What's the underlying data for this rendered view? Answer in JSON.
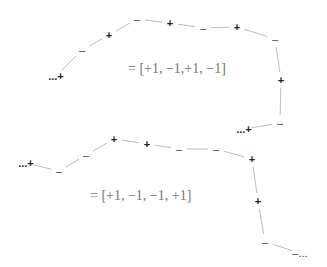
{
  "diagram": {
    "chains": [
      {
        "name": "chain-a",
        "equation": "= [+1, −1,+1, −1]",
        "equation_pos": [
          128,
          70
        ],
        "nodes": [
          {
            "label": "...+",
            "x": 56,
            "y": 76
          },
          {
            "label": "–",
            "x": 82,
            "y": 50
          },
          {
            "label": "+",
            "x": 109,
            "y": 35
          },
          {
            "label": "–",
            "x": 137,
            "y": 19
          },
          {
            "label": "+",
            "x": 170,
            "y": 23
          },
          {
            "label": "–",
            "x": 203,
            "y": 28
          },
          {
            "label": "+",
            "x": 237,
            "y": 27
          },
          {
            "label": "–",
            "x": 275,
            "y": 39
          },
          {
            "label": "+",
            "x": 281,
            "y": 80
          },
          {
            "label": "–",
            "x": 280,
            "y": 123
          },
          {
            "label": "...+",
            "x": 244,
            "y": 129
          }
        ]
      },
      {
        "name": "chain-b",
        "equation": "= [+1, −1, −1, +1]",
        "equation_pos": [
          90,
          197
        ],
        "nodes": [
          {
            "label": "...+",
            "x": 26,
            "y": 163
          },
          {
            "label": "–",
            "x": 59,
            "y": 171
          },
          {
            "label": "–",
            "x": 86,
            "y": 155
          },
          {
            "label": "+",
            "x": 114,
            "y": 139
          },
          {
            "label": "+",
            "x": 147,
            "y": 144
          },
          {
            "label": "–",
            "x": 179,
            "y": 149
          },
          {
            "label": "–",
            "x": 216,
            "y": 149
          },
          {
            "label": "+",
            "x": 252,
            "y": 159
          },
          {
            "label": "+",
            "x": 258,
            "y": 201
          },
          {
            "label": "–",
            "x": 265,
            "y": 242
          },
          {
            "label": "–...",
            "x": 300,
            "y": 253
          }
        ]
      }
    ],
    "colors": {
      "bond": "#bdbdbd",
      "symbol": "#222222",
      "equation": "#777777"
    }
  }
}
